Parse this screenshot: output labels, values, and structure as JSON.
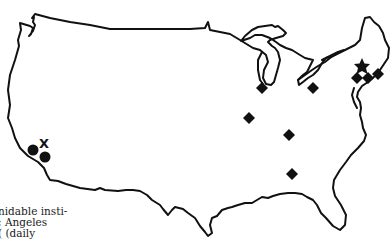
{
  "map": {
    "region": "Continental United States",
    "style": "black outline on white",
    "markers": {
      "star": [
        {
          "label": "star",
          "x": 362,
          "y": 67
        }
      ],
      "x": [
        {
          "label": "X",
          "x": 45,
          "y": 143
        }
      ],
      "circles": [
        {
          "x": 33,
          "y": 150
        },
        {
          "x": 45,
          "y": 157
        }
      ],
      "diamonds": [
        {
          "x": 262,
          "y": 88
        },
        {
          "x": 313,
          "y": 88
        },
        {
          "x": 249,
          "y": 118
        },
        {
          "x": 289,
          "y": 135
        },
        {
          "x": 292,
          "y": 174
        },
        {
          "x": 357,
          "y": 78
        },
        {
          "x": 368,
          "y": 78
        },
        {
          "x": 377,
          "y": 74
        }
      ]
    },
    "colors": {
      "ink": "#111111",
      "background": "#ffffff"
    }
  },
  "caption": {
    "lines": [
      "nidable insti-",
      "; Angeles",
      "( (daily"
    ]
  }
}
